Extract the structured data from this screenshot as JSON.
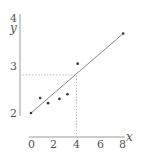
{
  "chart_data": {
    "type": "scatter",
    "title": "",
    "xlabel": "x",
    "ylabel": "y",
    "xlim": [
      0,
      8
    ],
    "ylim": [
      2,
      4
    ],
    "x_ticks": [
      0,
      2,
      4,
      6,
      8
    ],
    "x_tick_labels": [
      "0",
      "2",
      "4",
      "6",
      "8"
    ],
    "y_ticks": [
      2,
      3,
      4
    ],
    "y_tick_labels": [
      "2",
      "3",
      "4"
    ],
    "grid": false,
    "legend": null,
    "series": [
      {
        "name": "data points",
        "type": "scatter",
        "points": [
          {
            "x": 0.0,
            "y": 2.0
          },
          {
            "x": 0.8,
            "y": 2.32
          },
          {
            "x": 1.5,
            "y": 2.21
          },
          {
            "x": 2.5,
            "y": 2.3
          },
          {
            "x": 3.2,
            "y": 2.4
          },
          {
            "x": 4.1,
            "y": 3.05
          },
          {
            "x": 8.1,
            "y": 3.69
          }
        ]
      },
      {
        "name": "line of best fit",
        "type": "line",
        "points": [
          {
            "x": 0.0,
            "y": 2.0
          },
          {
            "x": 8.1,
            "y": 3.69
          }
        ]
      }
    ],
    "annotations": [
      {
        "type": "dotted-guide",
        "from": {
          "x": 4,
          "y": 2.0
        },
        "to": {
          "x": 4,
          "y": 2.81
        },
        "description": "vertical dotted line from x=4 up to the fit line"
      },
      {
        "type": "dotted-guide",
        "from": {
          "x": 0,
          "y": 2.81
        },
        "to": {
          "x": 4,
          "y": 2.81
        },
        "description": "horizontal dotted line from fit line at x=4 across to y-axis"
      }
    ]
  },
  "colors": {
    "axis": "#888888",
    "line": "#888888",
    "points": "#333333",
    "guide": "#bbbbbb",
    "text": "#555555"
  }
}
